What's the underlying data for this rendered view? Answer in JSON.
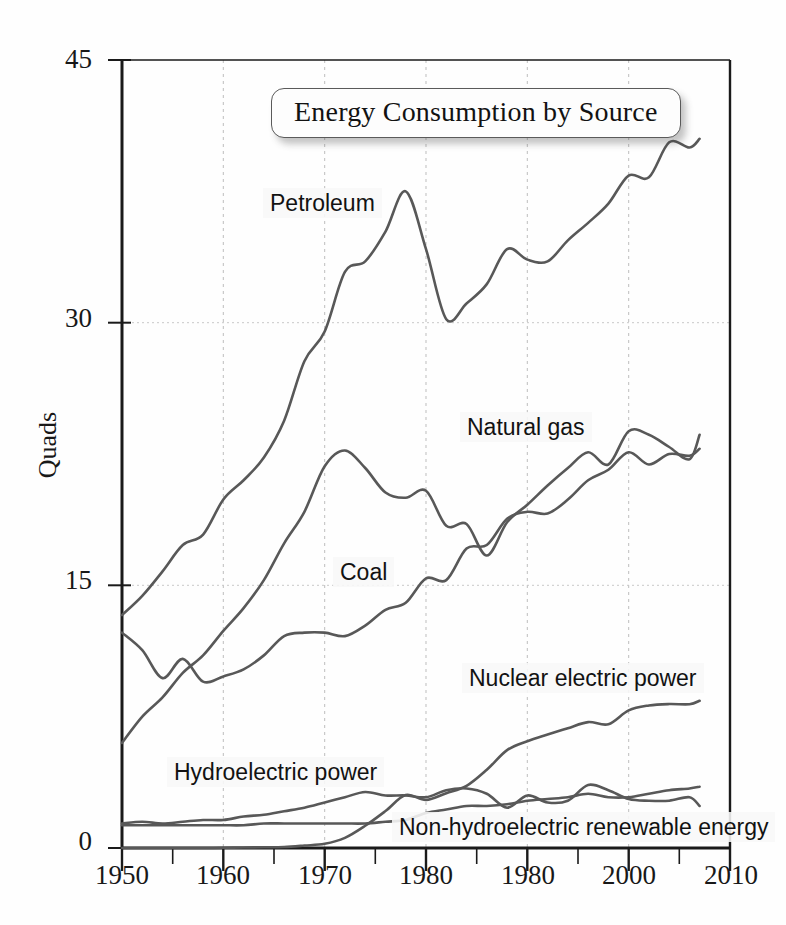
{
  "chart_data": {
    "type": "line",
    "title": "Energy Consumption by Source",
    "xlabel": "",
    "ylabel": "Quads",
    "xlim": [
      1950,
      2010
    ],
    "ylim": [
      0,
      45
    ],
    "xticks": [
      1950,
      1960,
      1970,
      1980,
      1980,
      2000,
      2010
    ],
    "xtick_values": [
      1950,
      1960,
      1970,
      1980,
      1990,
      2000,
      2010
    ],
    "yticks": [
      0,
      15,
      30,
      45
    ],
    "minor_xtick_step": 5,
    "grid": "dashed vertical gridlines at decades, dotted horizontal gridlines at 15 and 30",
    "legend": "inline series labels on plot",
    "x": [
      1950,
      1952,
      1954,
      1956,
      1958,
      1960,
      1962,
      1964,
      1966,
      1968,
      1970,
      1972,
      1974,
      1976,
      1978,
      1980,
      1982,
      1984,
      1986,
      1988,
      1990,
      1992,
      1994,
      1996,
      1998,
      2000,
      2002,
      2004,
      2006,
      2007
    ],
    "series": [
      {
        "name": "Petroleum",
        "values": [
          13.3,
          14.4,
          15.8,
          17.3,
          17.9,
          19.9,
          21.0,
          22.3,
          24.4,
          27.8,
          29.5,
          32.9,
          33.5,
          35.2,
          37.5,
          34.2,
          30.2,
          31.1,
          32.2,
          34.2,
          33.6,
          33.5,
          34.7,
          35.7,
          36.8,
          38.4,
          38.3,
          40.3,
          40.0,
          40.5
        ]
      },
      {
        "name": "Natural gas",
        "values": [
          6.0,
          7.5,
          8.6,
          10.0,
          11.0,
          12.4,
          13.7,
          15.3,
          17.4,
          19.2,
          21.8,
          22.7,
          21.7,
          20.3,
          20.0,
          20.4,
          18.4,
          18.5,
          16.7,
          18.6,
          19.6,
          20.7,
          21.7,
          22.6,
          21.9,
          23.8,
          23.6,
          22.9,
          22.2,
          23.6
        ]
      },
      {
        "name": "Coal",
        "values": [
          12.3,
          11.3,
          9.7,
          10.8,
          9.5,
          9.8,
          10.2,
          11.0,
          12.1,
          12.3,
          12.3,
          12.1,
          12.7,
          13.6,
          14.0,
          15.4,
          15.3,
          17.1,
          17.3,
          18.8,
          19.2,
          19.1,
          19.9,
          21.0,
          21.6,
          22.6,
          21.9,
          22.5,
          22.4,
          22.8
        ]
      },
      {
        "name": "Nuclear electric power",
        "values": [
          0.0,
          0.0,
          0.0,
          0.0,
          0.0,
          0.01,
          0.03,
          0.04,
          0.06,
          0.14,
          0.24,
          0.58,
          1.27,
          2.11,
          3.02,
          2.74,
          3.13,
          3.55,
          4.47,
          5.59,
          6.1,
          6.48,
          6.84,
          7.19,
          7.07,
          7.86,
          8.14,
          8.22,
          8.21,
          8.41
        ]
      },
      {
        "name": "Hydroelectric power",
        "values": [
          1.4,
          1.5,
          1.4,
          1.5,
          1.6,
          1.6,
          1.8,
          1.9,
          2.1,
          2.3,
          2.6,
          2.9,
          3.2,
          3.0,
          3.0,
          2.9,
          3.3,
          3.4,
          3.1,
          2.3,
          3.0,
          2.6,
          2.7,
          3.6,
          3.3,
          2.8,
          2.7,
          2.7,
          2.9,
          2.4
        ]
      },
      {
        "name": "Non-hydroelectric renewable energy",
        "values": [
          1.3,
          1.3,
          1.3,
          1.3,
          1.3,
          1.3,
          1.3,
          1.4,
          1.4,
          1.4,
          1.4,
          1.4,
          1.4,
          1.5,
          1.6,
          2.0,
          2.2,
          2.4,
          2.4,
          2.5,
          2.7,
          2.8,
          2.9,
          3.1,
          2.9,
          2.9,
          3.1,
          3.3,
          3.4,
          3.5
        ]
      }
    ],
    "series_colors": [
      "#585858",
      "#585858",
      "#585858",
      "#585858",
      "#585858",
      "#585858"
    ]
  },
  "labels": {
    "title": "Energy Consumption by Source",
    "yaxis": "Quads",
    "petroleum": "Petroleum",
    "natural_gas": "Natural gas",
    "coal": "Coal",
    "nuclear": "Nuclear electric power",
    "hydro": "Hydroelectric power",
    "nonhydro": "Non-hydroelectric renewable energy"
  },
  "axis": {
    "y": [
      "45",
      "30",
      "15",
      "0"
    ],
    "x": [
      "1950",
      "1960",
      "1970",
      "1980",
      "1980",
      "2000",
      "2010"
    ]
  },
  "colors": {
    "line": "#585858",
    "axis": "#1a1a1a",
    "grid": "#bdbdbd",
    "background": "#ffffff",
    "text": "#121212"
  }
}
